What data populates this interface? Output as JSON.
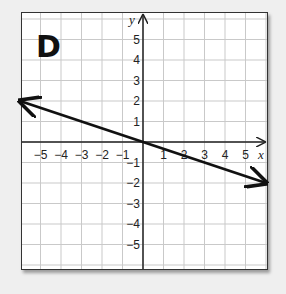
{
  "panel_label": "D",
  "chart_data": {
    "type": "line",
    "title": "D",
    "xlabel": "x",
    "ylabel": "y",
    "xlim": [
      -6,
      6
    ],
    "ylim": [
      -6,
      6.3
    ],
    "grid": true,
    "x_ticks": [
      -5,
      -4,
      -3,
      -2,
      -1,
      1,
      2,
      3,
      4,
      5
    ],
    "y_ticks": [
      5,
      4,
      3,
      2,
      1,
      -1,
      -2,
      -3,
      -4,
      -5
    ],
    "x_tick_labels": [
      "−5",
      "−4",
      "−3",
      "−2",
      "−1",
      "1",
      "2",
      "3",
      "4",
      "5"
    ],
    "y_tick_labels": [
      "5",
      "4",
      "3",
      "2",
      "1",
      "−1",
      "−2",
      "−3",
      "−4",
      "−5"
    ],
    "series": [
      {
        "name": "line",
        "equation": "y = -x/3",
        "x": [
          -6,
          0,
          6
        ],
        "y": [
          2,
          0,
          -2
        ],
        "arrows": "both"
      }
    ]
  }
}
